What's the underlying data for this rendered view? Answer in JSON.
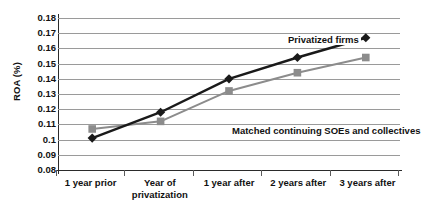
{
  "chart_data": {
    "type": "line",
    "title": "",
    "xlabel": "",
    "ylabel": "ROA (%)",
    "categories": [
      "1 year prior",
      "Year of privatization",
      "1 year after",
      "2 years after",
      "3 years after"
    ],
    "category_lines": [
      [
        "1 year prior"
      ],
      [
        "Year of",
        "privatization"
      ],
      [
        "1 year after"
      ],
      [
        "2 years after"
      ],
      [
        "3 years after"
      ]
    ],
    "ylim": [
      0.08,
      0.18
    ],
    "ytick_step": 0.01,
    "ytick_labels": [
      "0.18",
      "0.17",
      "0.16",
      "0.15",
      "0.14",
      "0.13",
      "0.12",
      "0.11",
      "0.1",
      "0.09",
      "0.08"
    ],
    "ytick_values": [
      0.18,
      0.17,
      0.16,
      0.15,
      0.14,
      0.13,
      0.12,
      0.11,
      0.1,
      0.09,
      0.08
    ],
    "grid": true,
    "legend_position": "inline-annotations",
    "series": [
      {
        "name": "Privatized firms",
        "values": [
          0.101,
          0.118,
          0.14,
          0.154,
          0.167
        ],
        "color": "#1a1a1a",
        "marker": "diamond"
      },
      {
        "name": "Matched continuing SOEs and collectives",
        "values": [
          0.107,
          0.112,
          0.132,
          0.144,
          0.154
        ],
        "color": "#8c8c8c",
        "marker": "square"
      }
    ],
    "annotations": [
      {
        "text": "Privatized firms",
        "series": "Privatized firms"
      },
      {
        "text": "Matched continuing SOEs and collectives",
        "series": "Matched continuing SOEs and collectives"
      }
    ]
  }
}
